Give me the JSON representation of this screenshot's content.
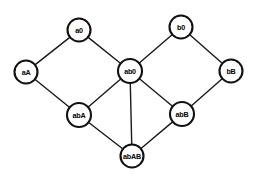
{
  "diagram": {
    "type": "node-link-lattice",
    "background_color": "#ffffff",
    "node_fill_color": "#ffffff",
    "node_stroke_color": "#111111",
    "edge_color": "#1a1a1a",
    "label_color": "#000000",
    "nodes": [
      {
        "id": "a0",
        "label": "a0",
        "x": 79,
        "y": 30,
        "r": 11.5
      },
      {
        "id": "b0",
        "label": "b0",
        "x": 181,
        "y": 27,
        "r": 11.5
      },
      {
        "id": "aA",
        "label": "aA",
        "x": 26,
        "y": 72,
        "r": 11.5
      },
      {
        "id": "ab0",
        "label": "ab0",
        "x": 130,
        "y": 71,
        "r": 12.0
      },
      {
        "id": "bB",
        "label": "bB",
        "x": 231,
        "y": 71,
        "r": 11.5
      },
      {
        "id": "abA",
        "label": "abA",
        "x": 79,
        "y": 115,
        "r": 12.0
      },
      {
        "id": "abB",
        "label": "abB",
        "x": 182,
        "y": 114,
        "r": 12.0
      },
      {
        "id": "abAB",
        "label": "abAB",
        "x": 132,
        "y": 156,
        "r": 11.5
      }
    ],
    "edges": [
      {
        "from": "aA",
        "to": "a0"
      },
      {
        "from": "a0",
        "to": "ab0"
      },
      {
        "from": "ab0",
        "to": "b0"
      },
      {
        "from": "b0",
        "to": "bB"
      },
      {
        "from": "aA",
        "to": "abA"
      },
      {
        "from": "abA",
        "to": "ab0"
      },
      {
        "from": "ab0",
        "to": "abB"
      },
      {
        "from": "ab0",
        "to": "abAB"
      },
      {
        "from": "bB",
        "to": "abB"
      },
      {
        "from": "abA",
        "to": "abAB"
      },
      {
        "from": "abB",
        "to": "abAB"
      }
    ]
  }
}
